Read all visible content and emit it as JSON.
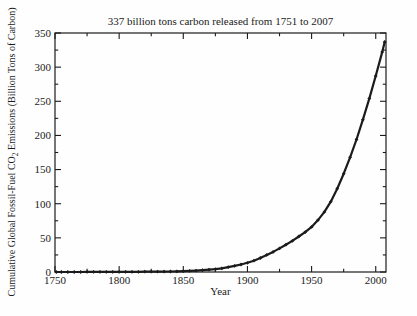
{
  "figure": {
    "title": "337 billion tons carbon released from 1751 to 2007",
    "xlabel": "Year",
    "ylabel_pre": "Cumulative Global Fossil-Fuel CO",
    "ylabel_sub": "2",
    "ylabel_post": " Emissions (Billion Tons of Carbon)"
  },
  "colors": {
    "ink": "#1b1b1b",
    "background": "#fefefe"
  },
  "chart_data": {
    "type": "line",
    "title": "337 billion tons carbon released from 1751 to 2007",
    "xlabel": "Year",
    "ylabel": "Cumulative Global Fossil-Fuel CO2 Emissions (Billion Tons of Carbon)",
    "xlim": [
      1750,
      2008
    ],
    "ylim": [
      0,
      350
    ],
    "xticks": [
      1750,
      1800,
      1850,
      1900,
      1950,
      2000
    ],
    "xminorticks": [
      1775,
      1825,
      1875,
      1925,
      1975
    ],
    "yticks": [
      0,
      50,
      100,
      150,
      200,
      250,
      300,
      350
    ],
    "yminorticks": [
      25,
      75,
      125,
      175,
      225,
      275,
      325
    ],
    "grid": false,
    "legend": "none",
    "marker": "diamond",
    "line_color": "#1b1b1b",
    "series": [
      {
        "name": "Cumulative global fossil-fuel CO2 emissions (billion tons of carbon)",
        "points": [
          [
            1751,
            0.003
          ],
          [
            1755,
            0.015
          ],
          [
            1760,
            0.03
          ],
          [
            1765,
            0.045
          ],
          [
            1770,
            0.06
          ],
          [
            1775,
            0.075
          ],
          [
            1780,
            0.09
          ],
          [
            1785,
            0.11
          ],
          [
            1790,
            0.13
          ],
          [
            1795,
            0.16
          ],
          [
            1800,
            0.19
          ],
          [
            1805,
            0.23
          ],
          [
            1810,
            0.27
          ],
          [
            1815,
            0.32
          ],
          [
            1820,
            0.37
          ],
          [
            1825,
            0.44
          ],
          [
            1830,
            0.51
          ],
          [
            1835,
            0.63
          ],
          [
            1840,
            0.78
          ],
          [
            1845,
            0.95
          ],
          [
            1850,
            1.2
          ],
          [
            1855,
            1.55
          ],
          [
            1860,
            2.0
          ],
          [
            1865,
            2.6
          ],
          [
            1870,
            3.3
          ],
          [
            1875,
            4.2
          ],
          [
            1880,
            5.4
          ],
          [
            1885,
            7.0
          ],
          [
            1890,
            9.0
          ],
          [
            1895,
            11.0
          ],
          [
            1900,
            13.5
          ],
          [
            1905,
            16.5
          ],
          [
            1910,
            20.5
          ],
          [
            1915,
            25
          ],
          [
            1920,
            29.5
          ],
          [
            1925,
            34.5
          ],
          [
            1930,
            40
          ],
          [
            1935,
            45.5
          ],
          [
            1940,
            52
          ],
          [
            1945,
            58.5
          ],
          [
            1950,
            66
          ],
          [
            1955,
            76
          ],
          [
            1960,
            88
          ],
          [
            1965,
            103
          ],
          [
            1970,
            122
          ],
          [
            1975,
            144
          ],
          [
            1980,
            168
          ],
          [
            1985,
            194
          ],
          [
            1990,
            223
          ],
          [
            1995,
            254
          ],
          [
            2000,
            287
          ],
          [
            2005,
            322
          ],
          [
            2007,
            337
          ]
        ]
      }
    ]
  }
}
